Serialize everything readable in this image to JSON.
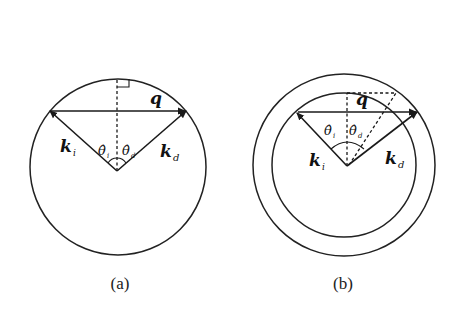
{
  "figure": {
    "panels": [
      {
        "id": "a",
        "caption": "(a)",
        "circles": [
          {
            "cx": 118,
            "cy": 167,
            "r": 88
          }
        ],
        "labels": {
          "q": "q",
          "ki_main": "k",
          "ki_sub": "i",
          "kd_main": "k",
          "kd_sub": "d",
          "theta_i_main": "θ̂",
          "theta_i_sub": "i",
          "theta_d_main": "θ̂",
          "theta_d_sub": "d"
        }
      },
      {
        "id": "b",
        "caption": "(b)",
        "circles": [
          {
            "cx": 344,
            "cy": 165,
            "r": 91,
            "role": "outer"
          },
          {
            "cx": 344,
            "cy": 165,
            "r": 72,
            "role": "inner"
          }
        ],
        "labels": {
          "q": "q",
          "ki_main": "k",
          "ki_sub": "i",
          "kd_main": "k",
          "kd_sub": "d",
          "theta_i_main": "θ̂",
          "theta_i_sub": "i",
          "theta_d_main": "θ̂",
          "theta_d_sub": "d"
        }
      }
    ],
    "colors": {
      "stroke": "#1a1a1a",
      "background": "#ffffff"
    }
  }
}
